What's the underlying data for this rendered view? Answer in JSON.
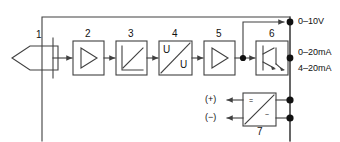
{
  "diagram": {
    "stroke_color": "#404040",
    "dot_color": "#111111",
    "background": "#ffffff",
    "enclosure": {
      "label": "device housing"
    },
    "blocks": [
      {
        "id": "1",
        "number": "1",
        "name": "sensor-element",
        "symbol": "hexagon-arrow"
      },
      {
        "id": "2",
        "number": "2",
        "name": "amplifier",
        "symbol": "triangle"
      },
      {
        "id": "3",
        "number": "3",
        "name": "linearization",
        "symbol": "axis-ramp"
      },
      {
        "id": "4",
        "number": "4",
        "name": "voltage-converter",
        "symbol": "U/U",
        "top_text": "U",
        "bottom_text": "U"
      },
      {
        "id": "5",
        "number": "5",
        "name": "output-amplifier",
        "symbol": "triangle"
      },
      {
        "id": "6",
        "number": "6",
        "name": "current-output-stage",
        "symbol": "transistor-pair"
      },
      {
        "id": "7",
        "number": "7",
        "name": "power-supply-converter",
        "symbol": "dc-converter",
        "top_text": "=",
        "bottom_text": "~"
      }
    ],
    "outputs": [
      {
        "name": "voltage-output",
        "label": "0–10V"
      },
      {
        "name": "current-output-0-20",
        "label": "0–20mA"
      },
      {
        "name": "current-output-4-20",
        "label": "4–20mA"
      }
    ],
    "supply": [
      {
        "name": "supply-positive",
        "label": "(+)"
      },
      {
        "name": "supply-negative",
        "label": "(−)"
      }
    ]
  }
}
